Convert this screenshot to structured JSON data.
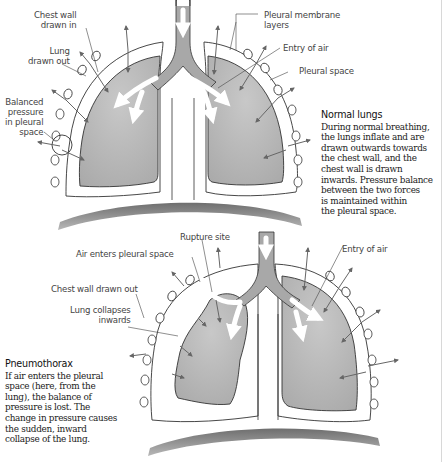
{
  "colors": {
    "lung_fill": "#b3b3b3",
    "line": "#333333",
    "arrow": "#666666",
    "airway": "#a8a8a8",
    "diaphragm": "#8a8a8a"
  },
  "normal": {
    "title": "Normal lungs",
    "body": "During normal breathing,\nthe lungs inflate and are\ndrawn outwards towards\nthe chest wall, and the\nchest wall is drawn\ninwards. Pressure balance\nbetween the two forces\nis maintained within\nthe pleural space.",
    "labels": {
      "chest_wall_drawn_in": "Chest wall\ndrawn in",
      "lung_drawn_out": "Lung\ndrawn out",
      "balanced_pressure": "Balanced\npressure\nin pleural\nspace",
      "pleural_membrane_layers": "Pleural membrane\nlayers",
      "entry_of_air": "Entry of air",
      "pleural_space": "Pleural space"
    }
  },
  "pneumothorax": {
    "title": "Pneumothorax",
    "body": "If air enters the pleural\nspace (here, from the\nlung), the balance of\npressure is lost. The\nchange in pressure causes\nthe sudden, inward\ncollapse of the lung.",
    "labels": {
      "rupture_site": "Rupture site",
      "air_enters_pleural_space": "Air enters pleural space",
      "chest_wall_drawn_out": "Chest wall drawn out",
      "lung_collapses_inwards": "Lung collapses\ninwards",
      "entry_of_air": "Entry of air"
    }
  }
}
